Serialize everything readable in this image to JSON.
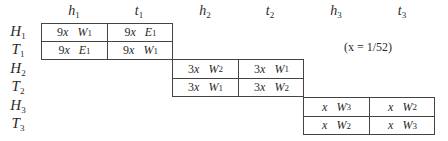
{
  "columns": [
    {
      "base": "h",
      "sub": "1"
    },
    {
      "base": "t",
      "sub": "1"
    },
    {
      "base": "h",
      "sub": "2"
    },
    {
      "base": "t",
      "sub": "2"
    },
    {
      "base": "h",
      "sub": "3"
    },
    {
      "base": "t",
      "sub": "3"
    }
  ],
  "rows": [
    {
      "base": "H",
      "sub": "1"
    },
    {
      "base": "T",
      "sub": "1"
    },
    {
      "base": "H",
      "sub": "2"
    },
    {
      "base": "T",
      "sub": "2"
    },
    {
      "base": "H",
      "sub": "3"
    },
    {
      "base": "T",
      "sub": "3"
    }
  ],
  "note": "(x = 1/52)",
  "blocks": [
    {
      "cells": [
        [
          {
            "coef": "9",
            "x": "x",
            "var": "W",
            "sub": "1"
          },
          {
            "coef": "9",
            "x": "x",
            "var": "E",
            "sub": "1"
          }
        ],
        [
          {
            "coef": "9",
            "x": "x",
            "var": "E",
            "sub": "1"
          },
          {
            "coef": "9",
            "x": "x",
            "var": "W",
            "sub": "1"
          }
        ]
      ]
    },
    {
      "cells": [
        [
          {
            "coef": "3",
            "x": "x",
            "var": "W",
            "sub": "2"
          },
          {
            "coef": "3",
            "x": "x",
            "var": "W",
            "sub": "1"
          }
        ],
        [
          {
            "coef": "3",
            "x": "x",
            "var": "W",
            "sub": "1"
          },
          {
            "coef": "3",
            "x": "x",
            "var": "W",
            "sub": "2"
          }
        ]
      ]
    },
    {
      "cells": [
        [
          {
            "coef": "",
            "x": "x",
            "var": "W",
            "sub": "3"
          },
          {
            "coef": "",
            "x": "x",
            "var": "W",
            "sub": "2"
          }
        ],
        [
          {
            "coef": "",
            "x": "x",
            "var": "W",
            "sub": "2"
          },
          {
            "coef": "",
            "x": "x",
            "var": "W",
            "sub": "3"
          }
        ]
      ]
    }
  ]
}
